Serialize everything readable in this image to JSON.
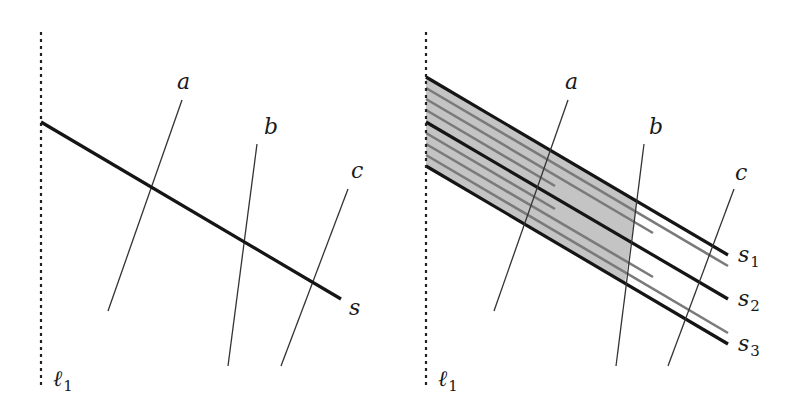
{
  "figure": {
    "left_panel": {
      "boundary_line": {
        "label": "ℓ",
        "subscript": "1",
        "x": 41,
        "y1": 32,
        "y2": 388
      },
      "main_segment": {
        "label": "s",
        "x1": 41,
        "y1": 122,
        "x2": 341,
        "y2": 299,
        "label_x": 349,
        "label_y": 315
      },
      "transversals": [
        {
          "label": "a",
          "x1": 182,
          "y1": 100,
          "x2": 108,
          "y2": 311,
          "label_x": 177,
          "label_y": 89
        },
        {
          "label": "b",
          "x1": 257,
          "y1": 144,
          "x2": 228,
          "y2": 366,
          "label_x": 264,
          "label_y": 134
        },
        {
          "label": "c",
          "x1": 348,
          "y1": 189,
          "x2": 281,
          "y2": 366,
          "label_x": 351,
          "label_y": 178
        }
      ]
    },
    "right_panel": {
      "boundary_line": {
        "label": "ℓ",
        "subscript": "1",
        "x": 426,
        "y1": 32,
        "y2": 388
      },
      "segments": [
        {
          "label": "s",
          "subscript": "1",
          "x1": 426,
          "y1": 77,
          "x2": 728,
          "y2": 255,
          "label_x": 738,
          "label_y": 262
        },
        {
          "label": "s",
          "subscript": "2",
          "x1": 426,
          "y1": 122,
          "x2": 728,
          "y2": 299,
          "label_x": 738,
          "label_y": 306
        },
        {
          "label": "s",
          "subscript": "3",
          "x1": 426,
          "y1": 166,
          "x2": 728,
          "y2": 344,
          "label_x": 738,
          "label_y": 351
        }
      ],
      "gray_segments": [
        {
          "x1": 426,
          "y1": 88,
          "x2": 728,
          "y2": 266
        },
        {
          "x1": 426,
          "y1": 99,
          "x2": 653,
          "y2": 233
        },
        {
          "x1": 426,
          "y1": 110,
          "x2": 555,
          "y2": 186
        },
        {
          "x1": 426,
          "y1": 133,
          "x2": 555,
          "y2": 209
        },
        {
          "x1": 426,
          "y1": 144,
          "x2": 653,
          "y2": 277
        },
        {
          "x1": 426,
          "y1": 155,
          "x2": 728,
          "y2": 333
        }
      ],
      "shaded_region": {
        "points": "426,77 637,201 625,283 426,166",
        "fill": "#c4c4c4"
      },
      "transversals": [
        {
          "label": "a",
          "x1": 568,
          "y1": 100,
          "x2": 494,
          "y2": 311,
          "label_x": 565,
          "label_y": 89
        },
        {
          "label": "b",
          "x1": 644,
          "y1": 144,
          "x2": 616,
          "y2": 366,
          "label_x": 649,
          "label_y": 134
        },
        {
          "label": "c",
          "x1": 734,
          "y1": 189,
          "x2": 668,
          "y2": 366,
          "label_x": 735,
          "label_y": 180
        }
      ]
    },
    "colors": {
      "thick_line": "#151515",
      "gray_line": "#7a7a7a",
      "thin_line": "#333333",
      "shade": "#c4c4c4",
      "dotted": "#222222"
    }
  }
}
